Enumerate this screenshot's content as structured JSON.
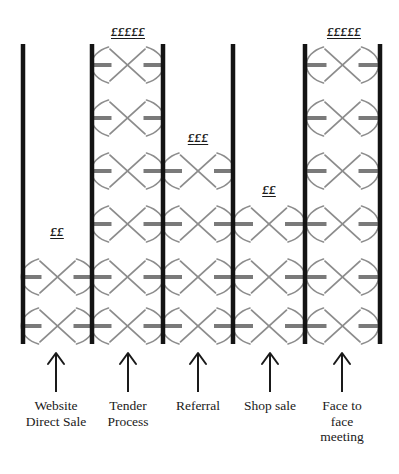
{
  "diagram": {
    "type": "ladder-channel-diagram",
    "background_color": "#ffffff",
    "rail_color": "#141414",
    "rung_color": "#7a7a7a",
    "glyph_color": "#8c8c8c",
    "arrow_color": "#1a1a1a",
    "rung_rows_y": [
      65,
      118,
      171,
      224,
      277,
      326
    ],
    "rail_top_y": 44,
    "rail_bottom_y": 344,
    "columns": [
      {
        "id": "website-direct-sale",
        "label": "Website\nDirect Sale",
        "price_label": "££",
        "price_label_x": 57,
        "price_label_y": 224,
        "rung_count": 2,
        "rung_rows": [
          5,
          6
        ],
        "left_rail_x": 23,
        "right_rail_x": 92,
        "arrow_x": 56,
        "label_x": 56,
        "label_y": 398
      },
      {
        "id": "tender-process",
        "label": "Tender\nProcess",
        "price_label": "£££££",
        "price_label_x": 128,
        "price_label_y": 24,
        "rung_count": 6,
        "rung_rows": [
          1,
          2,
          3,
          4,
          5,
          6
        ],
        "left_rail_x": 92,
        "right_rail_x": 163,
        "arrow_x": 128,
        "label_x": 128,
        "label_y": 398
      },
      {
        "id": "referral",
        "label": "Referral",
        "price_label": "£££",
        "price_label_x": 198,
        "price_label_y": 130,
        "rung_count": 4,
        "rung_rows": [
          3,
          4,
          5,
          6
        ],
        "left_rail_x": 163,
        "right_rail_x": 233,
        "arrow_x": 198,
        "label_x": 198,
        "label_y": 398
      },
      {
        "id": "shop-sale",
        "label": "Shop sale",
        "price_label": "££",
        "price_label_x": 269,
        "price_label_y": 182,
        "rung_count": 3,
        "rung_rows": [
          4,
          5,
          6
        ],
        "left_rail_x": 233,
        "right_rail_x": 305,
        "arrow_x": 270,
        "label_x": 270,
        "label_y": 398
      },
      {
        "id": "face-to-face-meeting",
        "label": "Face to\nface\nmeeting",
        "price_label": "£££££",
        "price_label_x": 344,
        "price_label_y": 24,
        "rung_count": 6,
        "rung_rows": [
          1,
          2,
          3,
          4,
          5,
          6
        ],
        "left_rail_x": 305,
        "right_rail_x": 380,
        "arrow_x": 342,
        "label_x": 342,
        "label_y": 398
      }
    ]
  }
}
